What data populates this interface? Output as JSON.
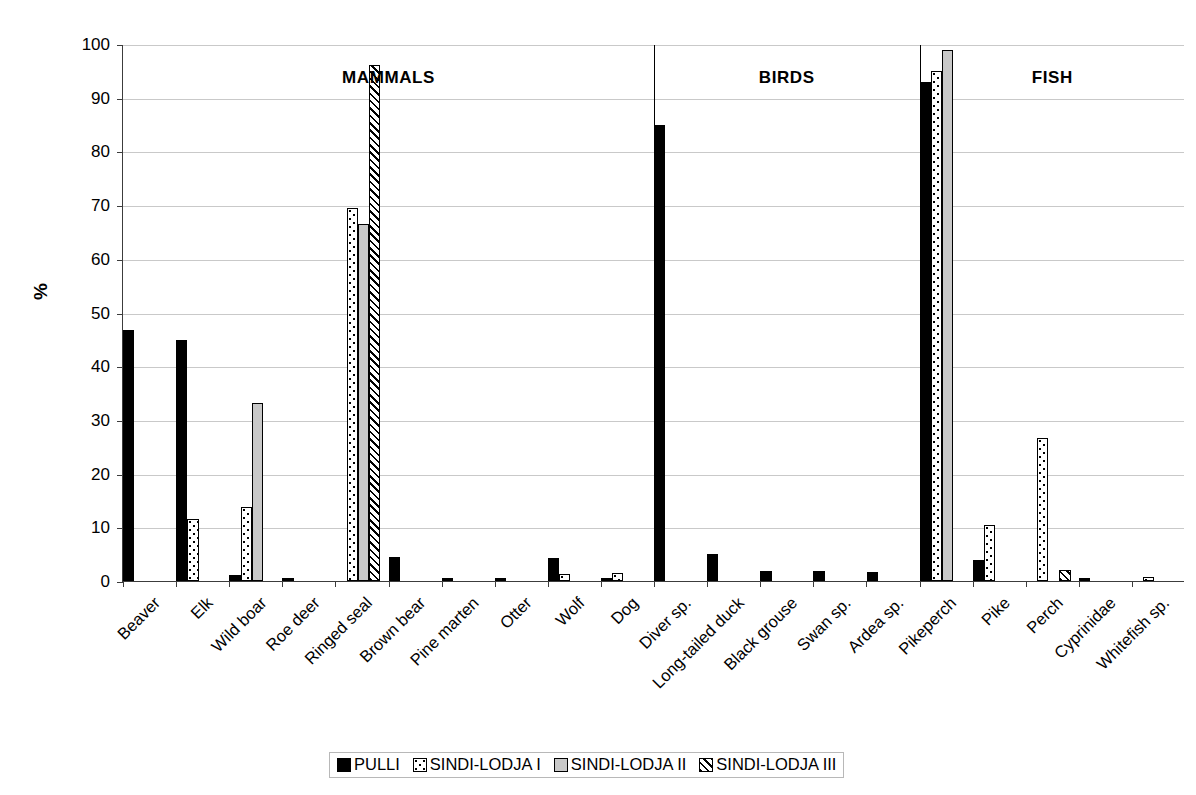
{
  "chart_data": {
    "type": "bar",
    "title": "",
    "xlabel": "",
    "ylabel": "%",
    "ylim": [
      0,
      100
    ],
    "ytick_step": 10,
    "yticks": [
      100,
      90,
      80,
      70,
      60,
      50,
      40,
      30,
      20,
      10,
      0
    ],
    "grid": true,
    "legend_position": "bottom-center",
    "categories": [
      "Beaver",
      "Elk",
      "Wild boar",
      "Roe deer",
      "Ringed seal",
      "Brown bear",
      "Pine marten",
      "Otter",
      "Wolf",
      "Dog",
      "Diver sp.",
      "Long-tailed duck",
      "Black grouse",
      "Swan sp.",
      "Ardea sp.",
      "Pikeperch",
      "Pike",
      "Perch",
      "Cyprinidae",
      "Whitefish sp."
    ],
    "series": [
      {
        "name": "PULLI",
        "fill": "solid-black",
        "color": "#000000",
        "values": [
          46.8,
          44.8,
          1.1,
          0.3,
          0,
          4.5,
          0.4,
          0.2,
          4.3,
          0.3,
          85.0,
          5.0,
          1.9,
          1.8,
          1.7,
          93.0,
          4.0,
          0,
          0.5,
          0
        ]
      },
      {
        "name": "SINDI-LODJA I",
        "fill": "dotted",
        "color": "#ffffff",
        "values": [
          0,
          11.5,
          13.8,
          0,
          69.5,
          0,
          0,
          0,
          1.3,
          1.5,
          0,
          0,
          0,
          0,
          0,
          95.0,
          10.4,
          26.6,
          0,
          0.8
        ]
      },
      {
        "name": "SINDI-LODJA II",
        "fill": "light-grey",
        "color": "#c8c8c8",
        "values": [
          0,
          0,
          33.2,
          0,
          66.4,
          0,
          0,
          0,
          0,
          0,
          0,
          0,
          0,
          0,
          0,
          98.8,
          0,
          0,
          0,
          0
        ]
      },
      {
        "name": "SINDI-LODJA III",
        "fill": "diagonal-hatch",
        "color": "#ffffff",
        "values": [
          0,
          0,
          0,
          0,
          96.0,
          0,
          0,
          0,
          0,
          0,
          0,
          0,
          0,
          0,
          0,
          0,
          0,
          2.0,
          0,
          0
        ]
      }
    ],
    "groups": [
      {
        "label": "MAMMALS",
        "start_index": 0,
        "end_index": 9
      },
      {
        "label": "BIRDS",
        "start_index": 10,
        "end_index": 14
      },
      {
        "label": "FISH",
        "start_index": 15,
        "end_index": 19
      }
    ]
  },
  "legend": {
    "items": [
      {
        "label": "PULLI"
      },
      {
        "label": "SINDI-LODJA I"
      },
      {
        "label": "SINDI-LODJA II"
      },
      {
        "label": "SINDI-LODJA III"
      }
    ]
  }
}
